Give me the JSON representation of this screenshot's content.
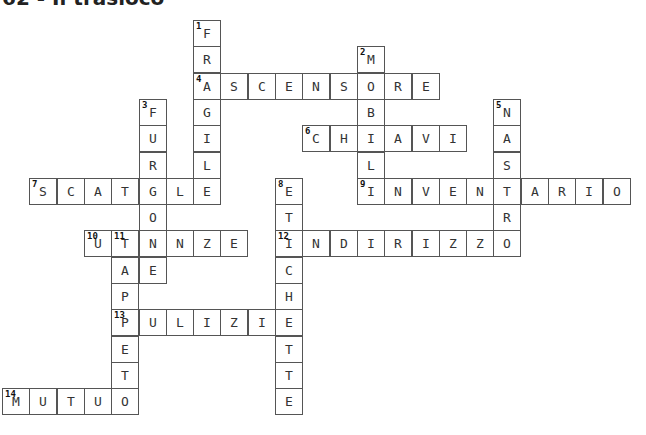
{
  "title": "62 - Il trasloco",
  "layout": {
    "origin_x": 2,
    "origin_y": 20,
    "cell_w": 27.3,
    "cell_h": 26.3
  },
  "words": [
    {
      "num": 1,
      "dir": "down",
      "row": 0,
      "col": 7,
      "answer": "FRAGILE"
    },
    {
      "num": 2,
      "dir": "down",
      "row": 1,
      "col": 13,
      "answer": "MOBILI"
    },
    {
      "num": 3,
      "dir": "down",
      "row": 3,
      "col": 5,
      "answer": "FURGONE"
    },
    {
      "num": 4,
      "dir": "across",
      "row": 2,
      "col": 7,
      "answer": "ASCENSORE"
    },
    {
      "num": 5,
      "dir": "down",
      "row": 3,
      "col": 18,
      "answer": "NASTRO"
    },
    {
      "num": 6,
      "dir": "across",
      "row": 4,
      "col": 11,
      "answer": "CHIAVI"
    },
    {
      "num": 7,
      "dir": "across",
      "row": 6,
      "col": 1,
      "answer": "SCATOLE"
    },
    {
      "num": 8,
      "dir": "down",
      "row": 6,
      "col": 10,
      "answer": "ETICHETTE"
    },
    {
      "num": 9,
      "dir": "across",
      "row": 6,
      "col": 13,
      "answer": "INVENTARIO"
    },
    {
      "num": 10,
      "dir": "across",
      "row": 8,
      "col": 3,
      "answer": "UTENZE"
    },
    {
      "num": 11,
      "dir": "down",
      "row": 8,
      "col": 4,
      "answer": "TAPPETO"
    },
    {
      "num": 12,
      "dir": "across",
      "row": 8,
      "col": 10,
      "answer": "INDIRIZZO"
    },
    {
      "num": 13,
      "dir": "across",
      "row": 11,
      "col": 4,
      "answer": "PULIZIE"
    },
    {
      "num": 14,
      "dir": "across",
      "row": 14,
      "col": 0,
      "answer": "MUTUO"
    }
  ]
}
